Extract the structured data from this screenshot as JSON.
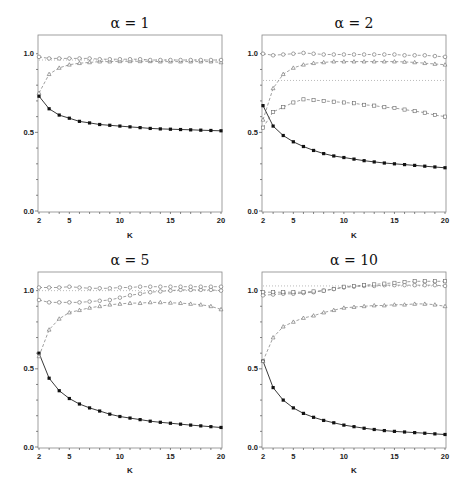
{
  "chart_data": [
    {
      "type": "line",
      "title": "α = 1",
      "xlabel": "K",
      "ylabel": "",
      "xlim": [
        2,
        20
      ],
      "ylim": [
        0.0,
        1.1
      ],
      "xticks": [
        "2",
        "5",
        "10",
        "15",
        "20"
      ],
      "yticks": [
        "0.0",
        "0.5",
        "1.0"
      ],
      "x": [
        2,
        3,
        4,
        5,
        6,
        7,
        8,
        9,
        10,
        11,
        12,
        13,
        14,
        15,
        16,
        17,
        18,
        19,
        20
      ],
      "reference_line": 0.96,
      "series": [
        {
          "name": "solid-filled-squares",
          "marker": "filled-square",
          "line": "solid",
          "values": [
            0.73,
            0.65,
            0.61,
            0.59,
            0.57,
            0.56,
            0.55,
            0.545,
            0.54,
            0.535,
            0.53,
            0.525,
            0.522,
            0.52,
            0.518,
            0.516,
            0.514,
            0.512,
            0.51
          ]
        },
        {
          "name": "dashed-triangles",
          "marker": "triangle",
          "line": "dashed",
          "values": [
            0.75,
            0.87,
            0.91,
            0.93,
            0.94,
            0.945,
            0.95,
            0.95,
            0.952,
            0.952,
            0.952,
            0.952,
            0.95,
            0.95,
            0.95,
            0.95,
            0.95,
            0.95,
            0.945
          ]
        },
        {
          "name": "dashed-circles",
          "marker": "circle",
          "line": "dashed",
          "values": [
            0.98,
            0.97,
            0.97,
            0.97,
            0.97,
            0.97,
            0.965,
            0.965,
            0.965,
            0.965,
            0.965,
            0.96,
            0.96,
            0.96,
            0.96,
            0.96,
            0.96,
            0.96,
            0.96
          ]
        }
      ]
    },
    {
      "type": "line",
      "title": "α = 2",
      "xlabel": "K",
      "ylabel": "",
      "xlim": [
        2,
        20
      ],
      "ylim": [
        0.0,
        1.1
      ],
      "xticks": [
        "2",
        "5",
        "10",
        "15",
        "20"
      ],
      "yticks": [
        "0.0",
        "0.5",
        "1.0"
      ],
      "x": [
        2,
        3,
        4,
        5,
        6,
        7,
        8,
        9,
        10,
        11,
        12,
        13,
        14,
        15,
        16,
        17,
        18,
        19,
        20
      ],
      "reference_line": 0.83,
      "series": [
        {
          "name": "solid-filled-squares",
          "marker": "filled-square",
          "line": "solid",
          "values": [
            0.67,
            0.54,
            0.48,
            0.44,
            0.41,
            0.385,
            0.365,
            0.35,
            0.34,
            0.33,
            0.32,
            0.312,
            0.305,
            0.3,
            0.295,
            0.29,
            0.285,
            0.28,
            0.275
          ]
        },
        {
          "name": "dashed-triangles",
          "marker": "triangle",
          "line": "dashed",
          "values": [
            0.58,
            0.78,
            0.87,
            0.91,
            0.93,
            0.94,
            0.945,
            0.95,
            0.95,
            0.95,
            0.95,
            0.95,
            0.95,
            0.95,
            0.948,
            0.945,
            0.94,
            0.935,
            0.93
          ]
        },
        {
          "name": "dashed-squares-open",
          "marker": "open-square",
          "line": "dashed",
          "values": [
            0.53,
            0.63,
            0.66,
            0.69,
            0.71,
            0.705,
            0.7,
            0.695,
            0.69,
            0.685,
            0.675,
            0.67,
            0.66,
            0.655,
            0.645,
            0.635,
            0.625,
            0.61,
            0.6
          ]
        },
        {
          "name": "dashed-circles",
          "marker": "circle",
          "line": "dashed",
          "values": [
            1.0,
            0.99,
            0.995,
            1.0,
            1.005,
            1.0,
            0.995,
            0.995,
            0.995,
            0.995,
            0.995,
            0.995,
            0.995,
            0.995,
            0.99,
            0.99,
            0.99,
            0.985,
            0.98
          ]
        }
      ]
    },
    {
      "type": "line",
      "title": "α = 5",
      "xlabel": "K",
      "ylabel": "",
      "xlim": [
        2,
        20
      ],
      "ylim": [
        0.0,
        1.1
      ],
      "xticks": [
        "2",
        "5",
        "10",
        "15",
        "20"
      ],
      "yticks": [
        "0.0",
        "0.5",
        "1.0"
      ],
      "x": [
        2,
        3,
        4,
        5,
        6,
        7,
        8,
        9,
        10,
        11,
        12,
        13,
        14,
        15,
        16,
        17,
        18,
        19,
        20
      ],
      "reference_line": 1.0,
      "series": [
        {
          "name": "solid-filled-squares",
          "marker": "filled-square",
          "line": "solid",
          "values": [
            0.6,
            0.44,
            0.36,
            0.31,
            0.275,
            0.25,
            0.23,
            0.21,
            0.195,
            0.185,
            0.175,
            0.165,
            0.158,
            0.152,
            0.146,
            0.14,
            0.135,
            0.13,
            0.125
          ]
        },
        {
          "name": "dashed-triangles",
          "marker": "triangle",
          "line": "dashed",
          "values": [
            0.58,
            0.75,
            0.82,
            0.86,
            0.875,
            0.89,
            0.9,
            0.91,
            0.915,
            0.92,
            0.92,
            0.925,
            0.925,
            0.922,
            0.92,
            0.915,
            0.91,
            0.9,
            0.88
          ]
        },
        {
          "name": "dashed-open-circles-lower",
          "marker": "circle",
          "line": "dashed",
          "values": [
            0.94,
            0.925,
            0.925,
            0.925,
            0.925,
            0.93,
            0.935,
            0.94,
            0.955,
            0.97,
            0.98,
            0.99,
            0.995,
            1.0,
            1.005,
            1.005,
            1.005,
            1.005,
            1.0
          ]
        },
        {
          "name": "dashed-circles-upper",
          "marker": "circle",
          "line": "dashed",
          "values": [
            1.02,
            1.02,
            1.02,
            1.025,
            1.02,
            1.015,
            1.015,
            1.015,
            1.02,
            1.02,
            1.025,
            1.025,
            1.025,
            1.025,
            1.025,
            1.025,
            1.025,
            1.025,
            1.025
          ]
        }
      ]
    },
    {
      "type": "line",
      "title": "α = 10",
      "xlabel": "K",
      "ylabel": "",
      "xlim": [
        2,
        20
      ],
      "ylim": [
        0.0,
        1.1
      ],
      "xticks": [
        "2",
        "5",
        "10",
        "15",
        "20"
      ],
      "yticks": [
        "0.0",
        "0.5",
        "1.0"
      ],
      "x": [
        2,
        3,
        4,
        5,
        6,
        7,
        8,
        9,
        10,
        11,
        12,
        13,
        14,
        15,
        16,
        17,
        18,
        19,
        20
      ],
      "reference_line": 1.03,
      "series": [
        {
          "name": "solid-filled-squares",
          "marker": "filled-square",
          "line": "solid",
          "values": [
            0.55,
            0.38,
            0.3,
            0.25,
            0.215,
            0.19,
            0.17,
            0.155,
            0.14,
            0.13,
            0.12,
            0.112,
            0.105,
            0.1,
            0.096,
            0.092,
            0.088,
            0.084,
            0.08
          ]
        },
        {
          "name": "dashed-triangles",
          "marker": "triangle",
          "line": "dashed",
          "values": [
            0.55,
            0.7,
            0.77,
            0.8,
            0.825,
            0.84,
            0.86,
            0.875,
            0.89,
            0.895,
            0.9,
            0.905,
            0.905,
            0.91,
            0.91,
            0.915,
            0.915,
            0.91,
            0.9
          ]
        },
        {
          "name": "dashed-circles-lower",
          "marker": "circle",
          "line": "dashed",
          "values": [
            0.97,
            0.975,
            0.98,
            0.98,
            0.985,
            0.99,
            1.0,
            1.01,
            1.02,
            1.025,
            1.03,
            1.03,
            1.035,
            1.035,
            1.035,
            1.035,
            1.035,
            1.035,
            1.03
          ]
        },
        {
          "name": "dashed-squares-upper",
          "marker": "open-square",
          "line": "dashed",
          "values": [
            0.99,
            0.99,
            0.99,
            0.99,
            0.99,
            0.995,
            1.0,
            1.01,
            1.025,
            1.03,
            1.035,
            1.04,
            1.045,
            1.05,
            1.055,
            1.06,
            1.06,
            1.06,
            1.06
          ]
        }
      ]
    }
  ],
  "panels": [
    {
      "title": "α = 1",
      "xlabel": "K"
    },
    {
      "title": "α = 2",
      "xlabel": "K"
    },
    {
      "title": "α = 5",
      "xlabel": "K"
    },
    {
      "title": "α = 10",
      "xlabel": "K"
    }
  ]
}
